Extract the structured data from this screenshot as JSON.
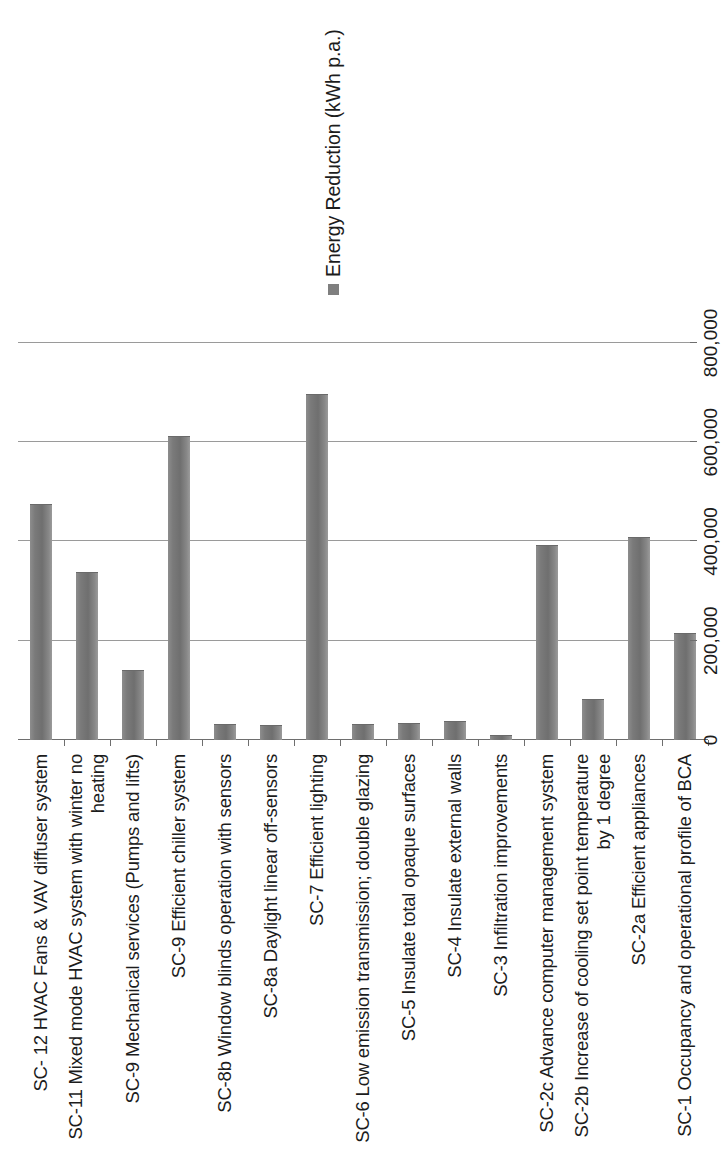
{
  "legend": {
    "entries": [
      {
        "label": "Energy Reduction (kWh p.a.)",
        "color": "#7f7f7f",
        "marker": "square"
      }
    ]
  },
  "axis": {
    "value_ticks": [
      "0",
      "200,000",
      "400,000",
      "600,000",
      "800,000"
    ]
  },
  "chart_data": {
    "type": "bar",
    "orientation": "vertical-rotated",
    "title": "",
    "subtitle": "",
    "xlabel": "",
    "ylabel": "",
    "ylim": [
      0,
      800000
    ],
    "ytick_interval": 200000,
    "grid": true,
    "legend_position": "top-right",
    "series_color": "#7f7f7f",
    "categories": [
      "SC- 12 HVAC Fans & VAV diffuser system",
      "SC-11 Mixed mode HVAC system with winter no heating",
      "SC-9 Mechanical services (Pumps and lifts)",
      "SC-9 Efficient chiller system",
      "SC-8b Window blinds operation with sensors",
      "SC-8a Daylight linear off-sensors",
      "SC-7 Efficient lighting",
      "SC-6 Low emission transmission; double glazing",
      "SC-5 Insulate total opaque surfaces",
      "SC-4 Insulate external walls",
      "SC-3 Infiltration improvements",
      "SC-2c Advance computer management system",
      "SC-2b Increase of cooling set point temperature by 1 degree",
      "SC-2a Efficient appliances",
      "SC-1 Occupancy and operational profile of BCA"
    ],
    "series": [
      {
        "name": "Energy Reduction (kWh p.a.)",
        "values": [
          473000,
          336000,
          140000,
          610000,
          30000,
          28000,
          695000,
          30000,
          32000,
          36000,
          8000,
          390000,
          80000,
          408000,
          214000
        ]
      }
    ]
  }
}
